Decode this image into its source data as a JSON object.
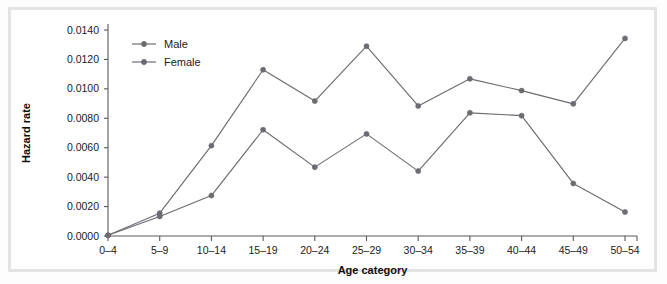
{
  "chart_data": {
    "type": "line",
    "title": "",
    "xlabel": "Age category",
    "ylabel": "Hazard rate",
    "categories": [
      "0–4",
      "5–9",
      "10–14",
      "15–19",
      "20–24",
      "25–29",
      "30–34",
      "35–39",
      "40–44",
      "45–49",
      "50–54"
    ],
    "ylim": [
      0.0,
      0.014
    ],
    "yticks": [
      0.0,
      0.002,
      0.004,
      0.006,
      0.008,
      0.01,
      0.012,
      0.014
    ],
    "ytick_labels": [
      "0.0000",
      "0.0020",
      "0.0040",
      "0.0060",
      "0.0080",
      "0.0100",
      "0.0120",
      "0.0140"
    ],
    "grid": false,
    "legend_position": "upper-left-inside",
    "series": [
      {
        "name": "Male",
        "color": "#6b6b72",
        "marker": "circle",
        "values": [
          5e-05,
          0.00133,
          0.00275,
          0.00722,
          0.00468,
          0.00694,
          0.00441,
          0.00837,
          0.00818,
          0.00357,
          0.00163
        ]
      },
      {
        "name": "Female",
        "color": "#6b6b72",
        "marker": "circle",
        "values": [
          5e-05,
          0.00155,
          0.00614,
          0.0113,
          0.00917,
          0.0129,
          0.00884,
          0.01068,
          0.00988,
          0.00898,
          0.01343
        ]
      }
    ]
  },
  "legend": {
    "entries": [
      {
        "label": "Male"
      },
      {
        "label": "Female"
      }
    ]
  },
  "colors": {
    "series": "#6b6b72",
    "axis": "#58585e",
    "frame": "#e3e3e3",
    "text": "#1b1b1b"
  }
}
